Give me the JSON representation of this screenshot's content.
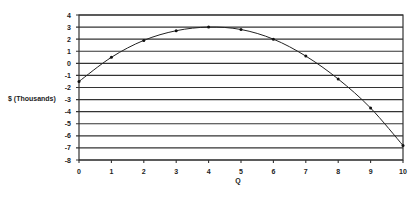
{
  "chart_data": {
    "type": "line",
    "title": "",
    "xlabel": "Q",
    "ylabel": "$ (Thousands)",
    "x": [
      0,
      1,
      2,
      3,
      4,
      5,
      6,
      7,
      8,
      9,
      10
    ],
    "series": [
      {
        "name": "Profit",
        "values": [
          -1.5,
          0.5,
          1.9,
          2.7,
          3.0,
          2.8,
          2.0,
          0.6,
          -1.3,
          -3.7,
          -6.8
        ],
        "markers": true,
        "color": "#222222"
      }
    ],
    "xlim": [
      0,
      10
    ],
    "ylim": [
      -8,
      4
    ],
    "xticks": [
      "0",
      "1",
      "2",
      "3",
      "4",
      "5",
      "6",
      "7",
      "8",
      "9",
      "10"
    ],
    "yticks": [
      "4",
      "3",
      "2",
      "1",
      "0",
      "-1",
      "-2",
      "-3",
      "-4",
      "-5",
      "-6",
      "-7",
      "-8"
    ],
    "grid": {
      "horizontal": true,
      "vertical": false
    },
    "legend": null
  }
}
